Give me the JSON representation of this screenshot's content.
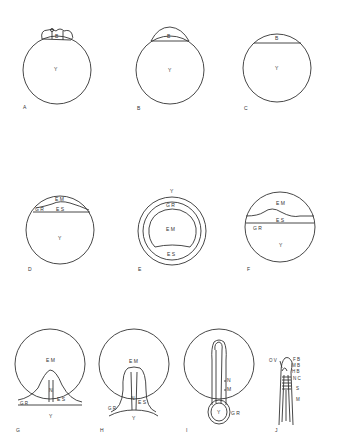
{
  "figure": {
    "panels": [
      {
        "id": "A",
        "labels": [
          "B",
          "Y"
        ]
      },
      {
        "id": "B",
        "labels": [
          "B",
          "Y"
        ]
      },
      {
        "id": "C",
        "labels": [
          "B",
          "Y"
        ]
      },
      {
        "id": "D",
        "labels": [
          "E M",
          "G R",
          "E S",
          "Y"
        ]
      },
      {
        "id": "E",
        "labels": [
          "Y",
          "G R",
          "E M",
          "E S"
        ]
      },
      {
        "id": "F",
        "labels": [
          "E M",
          "E S",
          "G R",
          "Y"
        ]
      },
      {
        "id": "G",
        "labels": [
          "E M",
          "N",
          "E S",
          "G R",
          "Y"
        ]
      },
      {
        "id": "H",
        "labels": [
          "E M",
          "N",
          "E S",
          "G R",
          "Y"
        ]
      },
      {
        "id": "I",
        "labels": [
          "N",
          "M",
          "Y",
          "G R"
        ]
      },
      {
        "id": "J",
        "labels": [
          "O V",
          "F B",
          "M B",
          "H B",
          "N C",
          "S",
          "M"
        ]
      }
    ],
    "text": {
      "A": "A",
      "B": "B",
      "C": "C",
      "D": "D",
      "E": "E",
      "F": "F",
      "G": "G",
      "H": "H",
      "I": "I",
      "J": "J",
      "B_lbl": "B",
      "Y_lbl": "Y",
      "EM": "E M",
      "ES": "E S",
      "GR": "G R",
      "N": "N",
      "M": "M",
      "OV": "O V",
      "FB": "F B",
      "MB": "M B",
      "HB": "H B",
      "NC": "N C",
      "S": "S"
    }
  }
}
